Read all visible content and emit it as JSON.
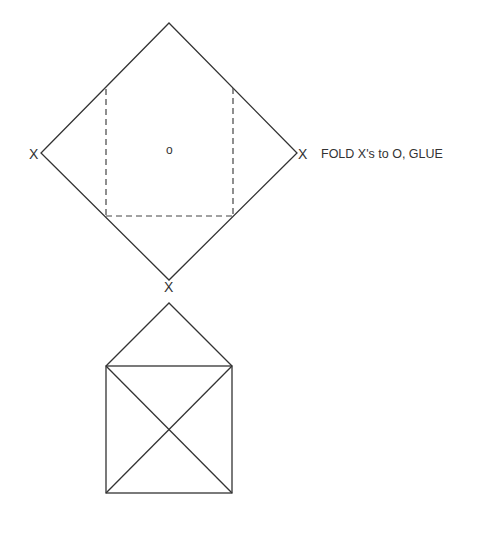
{
  "diagram": {
    "stroke_color": "#333333",
    "background_color": "#ffffff",
    "template": {
      "shape": "diamond",
      "vertices": {
        "top": [
          169,
          23
        ],
        "right": [
          297,
          153
        ],
        "bottom": [
          169,
          280
        ],
        "left": [
          41,
          153
        ]
      },
      "fold_lines": {
        "style": "dashed",
        "rect": {
          "x1": 106,
          "y1": 88,
          "x2": 233,
          "y2": 216
        }
      },
      "center_mark": "o",
      "corner_marks": {
        "left": "X",
        "right": "X",
        "bottom": "X"
      },
      "instruction": "FOLD X's to O, GLUE"
    },
    "result": {
      "shape": "envelope",
      "flap_peak": [
        169,
        303
      ],
      "body": {
        "x1": 106,
        "y1": 366,
        "x2": 232,
        "y2": 493
      }
    }
  }
}
